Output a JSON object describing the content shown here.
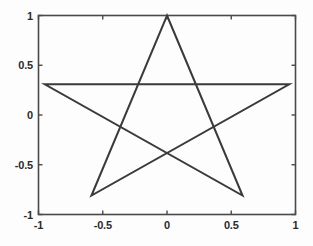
{
  "figure": {
    "background_color": "#fdfdfd",
    "axes_color": "#4a4a4a",
    "line_color": "#3a3a3a",
    "tick_label_color": "#2b2b2b"
  },
  "chart_data": {
    "type": "line",
    "title": "",
    "subtitle": "",
    "xlabel": "",
    "ylabel": "",
    "xlim": [
      -1,
      1
    ],
    "ylim": [
      -1,
      1
    ],
    "grid": false,
    "legend": [],
    "legend_position": "none",
    "xticks": [
      -1,
      -0.5,
      0,
      0.5,
      1
    ],
    "xticklabels": [
      "-1",
      "-0.5",
      "0",
      "0.5",
      "1"
    ],
    "yticks": [
      -1,
      -0.5,
      0,
      0.5,
      1
    ],
    "yticklabels": [
      "-1",
      "-0.5",
      "0",
      "0.5",
      "1"
    ],
    "box": true,
    "series": [
      {
        "name": "pentagram",
        "line_width": 2,
        "color": "#3a3a3a",
        "closed": true,
        "x": [
          0,
          0.5878,
          -0.9511,
          0.9511,
          -0.5878,
          0
        ],
        "y": [
          1,
          -0.809,
          0.309,
          0.309,
          -0.809,
          1
        ]
      }
    ],
    "vertices": [
      {
        "label": "top",
        "x": 0,
        "y": 1
      },
      {
        "label": "bottom-right",
        "x": 0.5878,
        "y": -0.809
      },
      {
        "label": "left",
        "x": -0.9511,
        "y": 0.309
      },
      {
        "label": "right",
        "x": 0.9511,
        "y": 0.309
      },
      {
        "label": "bottom-left",
        "x": -0.5878,
        "y": -0.809
      }
    ]
  }
}
